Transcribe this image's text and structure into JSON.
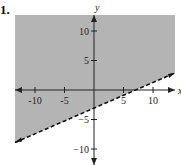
{
  "problem_label": "1.",
  "chart_data": {
    "type": "area",
    "title": "",
    "xlabel": "x",
    "ylabel": "y",
    "xlim": [
      -13,
      13
    ],
    "ylim": [
      -12,
      13
    ],
    "x_ticks": [
      -10,
      -5,
      5,
      10
    ],
    "y_ticks": [
      10,
      5,
      -5,
      -10
    ],
    "x_tick_labels": [
      "-10",
      "-5",
      "5",
      "10"
    ],
    "y_tick_labels": [
      "10",
      "5",
      "−5",
      "−10"
    ],
    "boundary_line": {
      "style": "dashed",
      "equation": "y = 0.45x - 3",
      "points": [
        [
          -13,
          -8.9
        ],
        [
          13,
          2.9
        ]
      ]
    },
    "shaded_region": "above boundary line",
    "shade_color": "#b4b4b4",
    "grid": false
  }
}
